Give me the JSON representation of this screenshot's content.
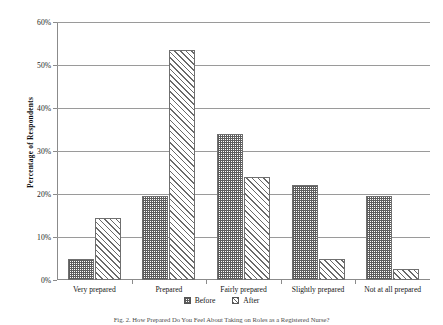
{
  "chart_data": {
    "type": "bar",
    "title": "",
    "xlabel": "",
    "ylabel": "Percentage of Respondents",
    "ylim": [
      0,
      60
    ],
    "ytick_labels": [
      "0%",
      "10%",
      "20%",
      "30%",
      "40%",
      "50%",
      "60%"
    ],
    "ytick_values": [
      0,
      10,
      20,
      30,
      40,
      50,
      60
    ],
    "grid": "horizontal",
    "legend_position": "bottom-center",
    "categories": [
      "Very prepared",
      "Prepared",
      "Fairly prepared",
      "Slightly prepared",
      "Not at all prepared"
    ],
    "series": [
      {
        "name": "Before",
        "pattern": "dotted-grid",
        "values": [
          5.0,
          19.5,
          34.0,
          22.0,
          19.5
        ]
      },
      {
        "name": "After",
        "pattern": "diagonal-hatch",
        "values": [
          14.5,
          53.5,
          24.0,
          5.0,
          2.5
        ]
      }
    ]
  },
  "legend": {
    "items": [
      {
        "label": "Before"
      },
      {
        "label": "After"
      }
    ]
  },
  "caption": {
    "text": "Fig. 2.  How Prepared Do You Feel About Taking on Roles as a Registered Nurse?"
  }
}
